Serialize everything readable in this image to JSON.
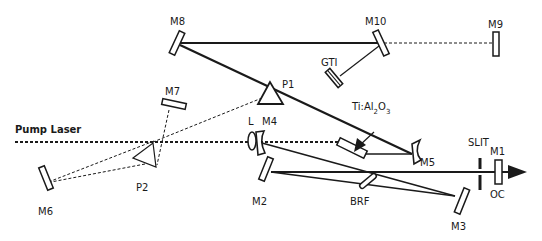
{
  "diagram": {
    "labels": {
      "pump_laser": "Pump Laser",
      "m1": "M1",
      "m2": "M2",
      "m3": "M3",
      "m4": "M4",
      "m5": "M5",
      "m6": "M6",
      "m7": "M7",
      "m8": "M8",
      "m9": "M9",
      "m10": "M10",
      "p1": "P1",
      "p2": "P2",
      "lens": "L",
      "gti": "GTI",
      "crystal_main": "Ti:Al",
      "crystal_sub1": "2",
      "crystal_o": "O",
      "crystal_sub2": "3",
      "slit": "SLIT",
      "oc": "OC",
      "brf": "BRF"
    },
    "colors": {
      "ink": "#1a1a1a",
      "background": "#ffffff"
    }
  }
}
